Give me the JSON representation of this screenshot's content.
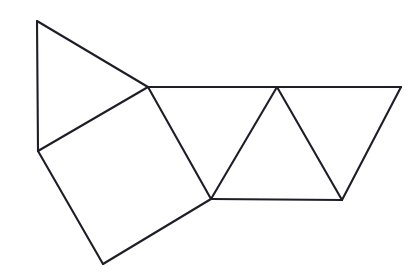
{
  "figure": {
    "kind": "geometric-line-drawing",
    "background_color": "#ffffff",
    "stroke_color": "#1e1e28",
    "stroke_width": 2.1,
    "canvas": {
      "width": 417,
      "height": 280
    },
    "vertices": {
      "top_apex": {
        "name": "A",
        "x": 37,
        "y": 21
      },
      "left_mid": {
        "name": "B",
        "x": 38,
        "y": 151
      },
      "bottom_left": {
        "name": "C",
        "x": 103,
        "y": 264
      },
      "upper_center_node": {
        "name": "D",
        "x": 148,
        "y": 87
      },
      "lower_center_node": {
        "name": "E",
        "x": 211,
        "y": 199
      },
      "triangle_peak": {
        "name": "F",
        "x": 277,
        "y": 87
      },
      "top_right": {
        "name": "G",
        "x": 401,
        "y": 87
      },
      "bottom_right": {
        "name": "H",
        "x": 342,
        "y": 200
      }
    },
    "edges": [
      {
        "id": "edge-A-B",
        "from": "top_apex",
        "to": "left_mid",
        "label": "left vertical edge"
      },
      {
        "id": "edge-A-D",
        "from": "top_apex",
        "to": "upper_center_node",
        "label": "upper triangle hypotenuse"
      },
      {
        "id": "edge-B-D",
        "from": "left_mid",
        "to": "upper_center_node",
        "label": "shared triangle/quad edge"
      },
      {
        "id": "edge-B-C",
        "from": "left_mid",
        "to": "bottom_left",
        "label": "quad lower-left edge"
      },
      {
        "id": "edge-C-E",
        "from": "bottom_left",
        "to": "lower_center_node",
        "label": "quad lower-right edge"
      },
      {
        "id": "edge-D-E",
        "from": "upper_center_node",
        "to": "lower_center_node",
        "label": "quad right edge"
      },
      {
        "id": "edge-D-G",
        "from": "upper_center_node",
        "to": "top_right",
        "label": "top horizontal edge"
      },
      {
        "id": "edge-E-F",
        "from": "lower_center_node",
        "to": "triangle_peak",
        "label": "middle triangle left leg"
      },
      {
        "id": "edge-F-H",
        "from": "triangle_peak",
        "to": "bottom_right",
        "label": "middle triangle right leg"
      },
      {
        "id": "edge-E-H",
        "from": "lower_center_node",
        "to": "bottom_right",
        "label": "bottom horizontal edge"
      },
      {
        "id": "edge-G-H",
        "from": "top_right",
        "to": "bottom_right",
        "label": "right slanted edge"
      }
    ],
    "faces": [
      {
        "id": "face-upper-triangle",
        "label": "upper left triangle",
        "points": "top_apex,upper_center_node,left_mid"
      },
      {
        "id": "face-quadrilateral",
        "label": "central quadrilateral",
        "points": "left_mid,upper_center_node,lower_center_node,bottom_left"
      },
      {
        "id": "face-left-triangle",
        "label": "left middle triangle",
        "points": "upper_center_node,triangle_peak,lower_center_node"
      },
      {
        "id": "face-right-triangle",
        "label": "right middle triangle",
        "points": "triangle_peak,top_right,bottom_right"
      },
      {
        "id": "face-center-triangle",
        "label": "center apex triangle",
        "points": "lower_center_node,triangle_peak,bottom_right"
      }
    ]
  }
}
